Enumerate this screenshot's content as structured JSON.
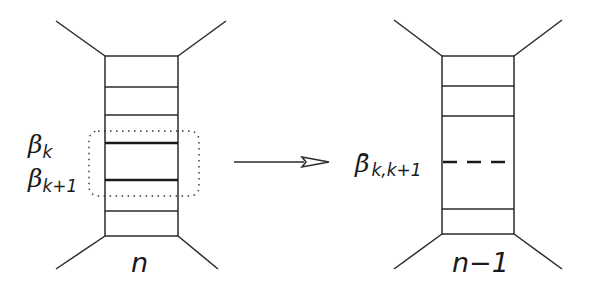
{
  "diagram": {
    "left_ladder": {
      "bottom_label": "n",
      "rung_labels": [
        {
          "symbol": "β",
          "subscript": "k"
        },
        {
          "symbol": "β",
          "subscript": "k+1"
        }
      ],
      "rung_count": 5,
      "highlighted_rungs": "dotted rounded box around β_k and β_k+1"
    },
    "arrow": {
      "direction": "right",
      "head_style": "open-triangle"
    },
    "right_ladder": {
      "bottom_label": "n−1",
      "rung_labels": [
        {
          "symbol": "β̄",
          "subscript": "k,k+1",
          "style": "dashed"
        }
      ],
      "rung_count": 4
    },
    "colors": {
      "stroke": "#2a2a2a",
      "background": "#ffffff"
    }
  }
}
